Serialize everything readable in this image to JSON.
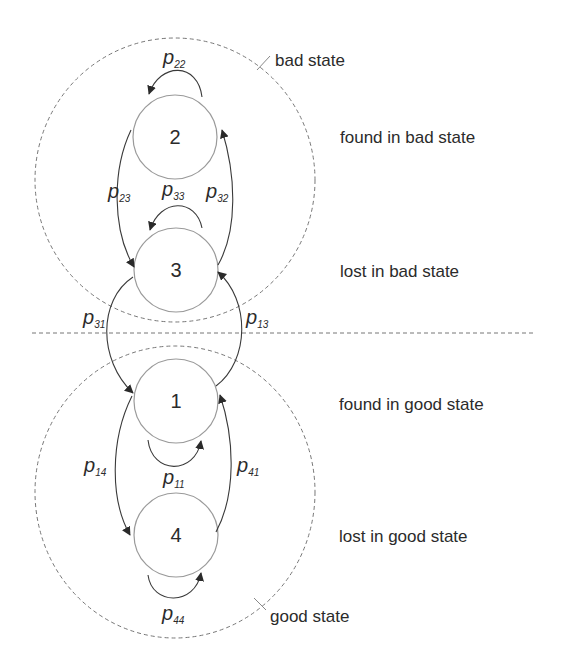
{
  "diagram": {
    "colors": {
      "line": "#3a3a3a",
      "circle": "#9a9a9a",
      "dashed": "#777777",
      "text": "#2b2b2b"
    },
    "regions": {
      "bad": {
        "label": "bad state"
      },
      "good": {
        "label": "good state"
      }
    },
    "nodes": [
      {
        "id": "2",
        "label": "2",
        "description": "found in bad state"
      },
      {
        "id": "3",
        "label": "3",
        "description": "lost in bad state"
      },
      {
        "id": "1",
        "label": "1",
        "description": "found in good state"
      },
      {
        "id": "4",
        "label": "4",
        "description": "lost in good state"
      }
    ],
    "transitions": {
      "p22": {
        "main": "p",
        "sub": "22"
      },
      "p23": {
        "main": "p",
        "sub": "23"
      },
      "p33": {
        "main": "p",
        "sub": "33"
      },
      "p32": {
        "main": "p",
        "sub": "32"
      },
      "p31": {
        "main": "p",
        "sub": "31"
      },
      "p13": {
        "main": "p",
        "sub": "13"
      },
      "p14": {
        "main": "p",
        "sub": "14"
      },
      "p11": {
        "main": "p",
        "sub": "11"
      },
      "p41": {
        "main": "p",
        "sub": "41"
      },
      "p44": {
        "main": "p",
        "sub": "44"
      }
    }
  }
}
